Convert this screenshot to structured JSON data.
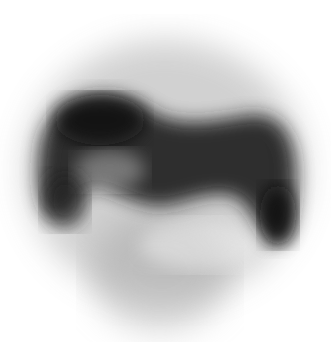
{
  "image": {
    "kind": "grayscale nuclear-medicine scintigraphy scan",
    "background": "#ffffff",
    "ink": "#1a1a1a",
    "description": "Noisy dark horseshoe/M-shaped uptake region with lighter halo; no visible text"
  }
}
